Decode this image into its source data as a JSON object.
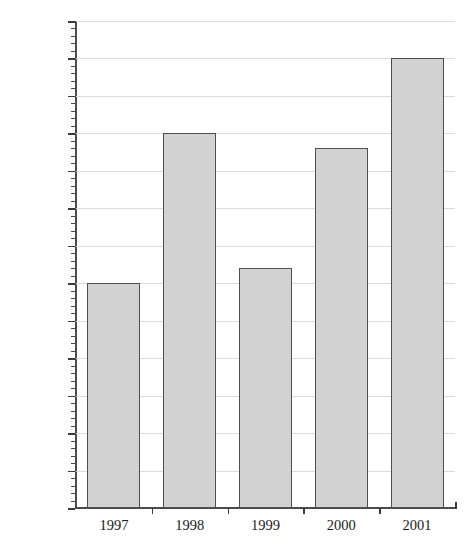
{
  "chart_data": {
    "type": "bar",
    "title": "",
    "xlabel": "",
    "ylabel": "Number of  cookies",
    "categories": [
      "1997",
      "1998",
      "1999",
      "2000",
      "2001"
    ],
    "values": [
      300,
      500,
      320,
      480,
      600
    ],
    "ylim": [
      0,
      650
    ],
    "y_tick_step": 50,
    "y_minor_tick_step": 10,
    "y_tick_labels": [
      "0",
      "50",
      "100",
      "150",
      "200",
      "250",
      "300",
      "350",
      "400",
      "450",
      "500",
      "550",
      "600",
      "650"
    ],
    "grid": true,
    "grid_axis": "y",
    "legend": null,
    "bar_fill_color": "#d2d2d2",
    "bar_border_color": "#4f4f4f",
    "grid_color": "#dcdcdc",
    "axis_color": "#4a4a4a",
    "background_color": "#ffffff"
  }
}
